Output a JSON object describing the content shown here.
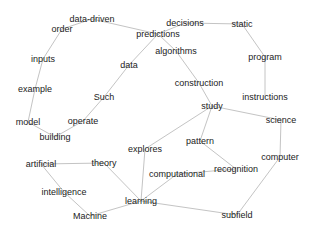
{
  "diagram": {
    "type": "word-graph",
    "edge_color": "#c4c4c4",
    "text_color": "#222222",
    "nodes": [
      {
        "id": "data-driven",
        "label": "data-driven",
        "x": 92,
        "y": 19
      },
      {
        "id": "order",
        "label": "order",
        "x": 62,
        "y": 29
      },
      {
        "id": "predictions",
        "label": "predictions",
        "x": 158,
        "y": 34
      },
      {
        "id": "decisions",
        "label": "decisions",
        "x": 185,
        "y": 23
      },
      {
        "id": "static",
        "label": "static",
        "x": 242,
        "y": 24
      },
      {
        "id": "algorithms",
        "label": "algorithms",
        "x": 176,
        "y": 51
      },
      {
        "id": "program",
        "label": "program",
        "x": 265,
        "y": 57
      },
      {
        "id": "inputs",
        "label": "inputs",
        "x": 43,
        "y": 59
      },
      {
        "id": "data",
        "label": "data",
        "x": 129,
        "y": 65
      },
      {
        "id": "construction",
        "label": "construction",
        "x": 199,
        "y": 83
      },
      {
        "id": "example",
        "label": "example",
        "x": 35,
        "y": 89
      },
      {
        "id": "instructions",
        "label": "instructions",
        "x": 265,
        "y": 97
      },
      {
        "id": "Such",
        "label": "Such",
        "x": 104,
        "y": 97
      },
      {
        "id": "study",
        "label": "study",
        "x": 212,
        "y": 106
      },
      {
        "id": "model",
        "label": "model",
        "x": 28,
        "y": 122
      },
      {
        "id": "operate",
        "label": "operate",
        "x": 83,
        "y": 121
      },
      {
        "id": "science",
        "label": "science",
        "x": 281,
        "y": 120
      },
      {
        "id": "building",
        "label": "building",
        "x": 55,
        "y": 137
      },
      {
        "id": "pattern",
        "label": "pattern",
        "x": 200,
        "y": 141
      },
      {
        "id": "explores",
        "label": "explores",
        "x": 145,
        "y": 149
      },
      {
        "id": "theory",
        "label": "theory",
        "x": 104,
        "y": 163
      },
      {
        "id": "artificial",
        "label": "artificial",
        "x": 41,
        "y": 164
      },
      {
        "id": "computer",
        "label": "computer",
        "x": 280,
        "y": 157
      },
      {
        "id": "recognition",
        "label": "recognition",
        "x": 236,
        "y": 169
      },
      {
        "id": "computational",
        "label": "computational",
        "x": 177,
        "y": 174
      },
      {
        "id": "intelligence",
        "label": "intelligence",
        "x": 64,
        "y": 192
      },
      {
        "id": "learning",
        "label": "learning",
        "x": 141,
        "y": 201
      },
      {
        "id": "Machine",
        "label": "Machine",
        "x": 90,
        "y": 216
      },
      {
        "id": "subfield",
        "label": "subfield",
        "x": 237,
        "y": 215
      }
    ],
    "edges": [
      [
        "order",
        "data-driven"
      ],
      [
        "data-driven",
        "predictions"
      ],
      [
        "predictions",
        "decisions"
      ],
      [
        "decisions",
        "static"
      ],
      [
        "predictions",
        "algorithms"
      ],
      [
        "algorithms",
        "construction"
      ],
      [
        "construction",
        "study"
      ],
      [
        "static",
        "program"
      ],
      [
        "program",
        "instructions"
      ],
      [
        "order",
        "inputs"
      ],
      [
        "inputs",
        "example"
      ],
      [
        "example",
        "model"
      ],
      [
        "model",
        "building"
      ],
      [
        "building",
        "operate"
      ],
      [
        "operate",
        "Such"
      ],
      [
        "Such",
        "data"
      ],
      [
        "data",
        "predictions"
      ],
      [
        "study",
        "science"
      ],
      [
        "study",
        "explores"
      ],
      [
        "study",
        "pattern"
      ],
      [
        "pattern",
        "recognition"
      ],
      [
        "recognition",
        "computational"
      ],
      [
        "computational",
        "learning"
      ],
      [
        "explores",
        "learning"
      ],
      [
        "theory",
        "learning"
      ],
      [
        "artificial",
        "theory"
      ],
      [
        "artificial",
        "intelligence"
      ],
      [
        "intelligence",
        "Machine"
      ],
      [
        "Machine",
        "learning"
      ],
      [
        "learning",
        "subfield"
      ],
      [
        "subfield",
        "computer"
      ],
      [
        "computer",
        "science"
      ]
    ]
  }
}
